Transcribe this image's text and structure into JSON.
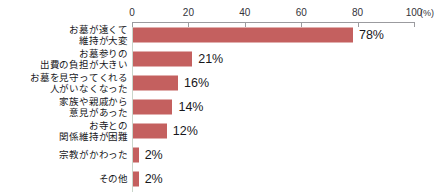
{
  "heading": {
    "text": "お墓の引っ越しを考えた理由（複数回答）",
    "clipped": true
  },
  "chart_data": {
    "type": "bar",
    "orientation": "horizontal",
    "title": "",
    "xlabel": "(%)",
    "ylabel": "",
    "xlim": [
      0,
      100
    ],
    "xticks": [
      0,
      20,
      40,
      60,
      80,
      100
    ],
    "xtick_labels": [
      "0",
      "20",
      "40",
      "60",
      "80",
      "100"
    ],
    "unit": "(%)",
    "grid": false,
    "legend": false,
    "bar_color": "#c4605f",
    "axis_color": "#9b9b9f",
    "baseline_color": "#c9d6cb",
    "categories": [
      "お墓が遠くて\n維持が大変",
      "お墓参りの\n出費の負担が大きい",
      "お墓を見守ってくれる\n人がいなくなった",
      "家族や親戚から\n意見があった",
      "お寺との\n関係維持が困難",
      "宗教がかわった",
      "その他"
    ],
    "values": [
      78,
      21,
      16,
      14,
      12,
      2,
      2
    ],
    "value_labels": [
      "78%",
      "21%",
      "16%",
      "14%",
      "12%",
      "2%",
      "2%"
    ]
  }
}
